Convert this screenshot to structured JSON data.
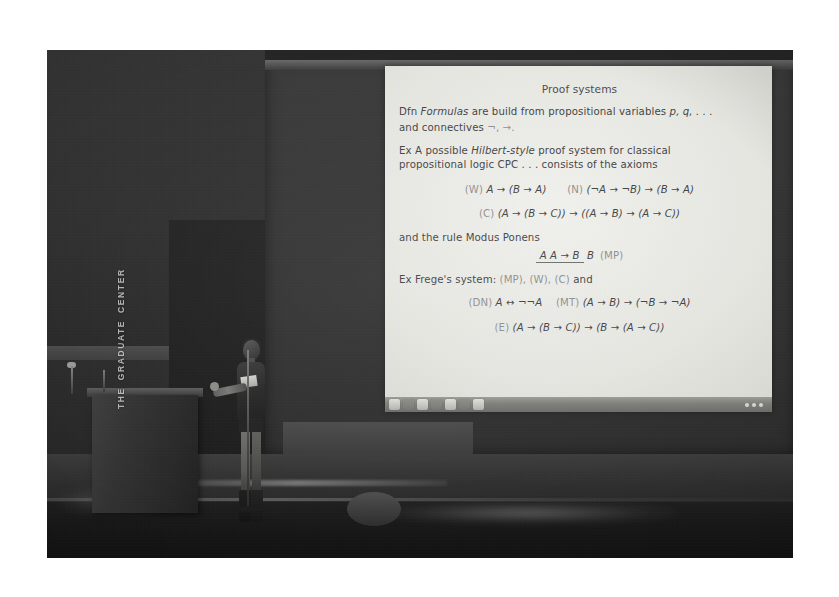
{
  "scene": {
    "kind": "photograph",
    "caption": "Lecture hall photo: speaker at a podium beside a projected logic slide",
    "venue_logo_line1": "THE",
    "venue_logo_line2": "GRADUATE",
    "venue_logo_line3": "CENTER"
  },
  "podium": {
    "logo_text": "THE GRADUATE CENTER"
  },
  "slide": {
    "title": "Proof systems",
    "definition": {
      "label": "Dfn",
      "term": "Formulas",
      "line1_rest": " are build from propositional variables ",
      "variables": "p, q, . . .",
      "line2_prefix": "and connectives ",
      "connectives": "¬, →."
    },
    "example1": {
      "label": "Ex",
      "line1_a": "A possible ",
      "style_term": "Hilbert-style",
      "line1_b": " proof system for classical",
      "line2": "propositional logic CPC . . . consists of the axioms"
    },
    "axioms": [
      {
        "tag": "(W)",
        "formula": "A → (B → A)"
      },
      {
        "tag": "(N)",
        "formula": "(¬A → ¬B) → (B → A)"
      },
      {
        "tag": "(C)",
        "formula": "(A → (B → C)) → ((A → B) → (A → C))"
      }
    ],
    "rule": {
      "intro": "and the rule Modus Ponens",
      "numerator": "A    A → B",
      "denominator": "B",
      "tag": "(MP)"
    },
    "example2": {
      "label": "Ex",
      "intro": "Frege's system:",
      "cited": "(MP), (W), (C)",
      "and": "and",
      "rows": [
        {
          "tag": "(DN)",
          "formula": "A ↔ ¬¬A"
        },
        {
          "tag": "(MT)",
          "formula": "(A → B) → (¬B → ¬A)"
        },
        {
          "tag": "(E)",
          "formula": "(A → (B → C)) → (B → (A → C))"
        }
      ]
    }
  },
  "taskbar": {
    "clock": "",
    "icons": [
      "app-icon-1",
      "app-icon-2",
      "app-icon-3",
      "app-icon-4",
      "app-icon-5",
      "app-icon-6",
      "app-icon-7"
    ]
  },
  "colors": {
    "photo_background": "#232323",
    "slide_paper": "#e9e9e4",
    "slide_text": "#414141",
    "slide_dim_text": "#8f8f8f",
    "page_background": "#ffffff",
    "taskbar": "#7e7e7a"
  }
}
